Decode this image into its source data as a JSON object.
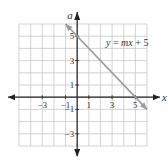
{
  "chart_data": {
    "type": "line",
    "title": "",
    "xlabel": "x",
    "ylabel": "a",
    "xlim": [
      -5,
      6
    ],
    "ylim": [
      -4,
      6
    ],
    "grid": true,
    "x_ticks": [
      -3,
      -1,
      1,
      3,
      5
    ],
    "x_tick_labels": [
      "−3",
      "−1",
      "1",
      "3",
      "5"
    ],
    "y_ticks": [
      5,
      3,
      1,
      -1,
      -3
    ],
    "y_tick_labels": [
      "5",
      "3",
      "1",
      "−1",
      "−3"
    ],
    "series": [
      {
        "name": "y = mx + 5",
        "x": [
          -1,
          6
        ],
        "y": [
          6,
          -1
        ],
        "slope": -1,
        "intercept": 5,
        "color": "#9a9a9a",
        "arrows": "both"
      }
    ],
    "annotations": [
      {
        "text_parts": [
          {
            "t": "y",
            "i": true
          },
          {
            "t": " = ",
            "i": false
          },
          {
            "t": "mx",
            "i": true
          },
          {
            "t": " + 5",
            "i": false
          }
        ],
        "at": [
          4.3,
          4.2
        ]
      }
    ],
    "colors": {
      "grid": "#c8c8c8",
      "axis": "#222222",
      "line": "#9a9a9a"
    }
  }
}
